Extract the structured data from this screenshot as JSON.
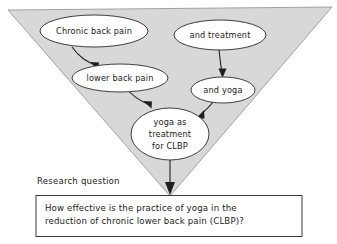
{
  "diagram": {
    "type": "funnel-concept-map",
    "funnel": {
      "name": "inverted-triangle-funnel",
      "fill_color": "#d8d8d8",
      "stroke_color": "#9a9a9a"
    },
    "nodes": [
      {
        "id": "chronic-back-pain",
        "label": "Chronic back pain",
        "lines": [
          "Chronic back pain"
        ]
      },
      {
        "id": "and-treatment",
        "label": "and treatment",
        "lines": [
          "and treatment"
        ]
      },
      {
        "id": "lower-back-pain",
        "label": "lower back pain",
        "lines": [
          "lower back pain"
        ]
      },
      {
        "id": "and-yoga",
        "label": "and yoga",
        "lines": [
          "and yoga"
        ]
      },
      {
        "id": "yoga-as-treatment-for-clbp",
        "label": "yoga as treatment for CLBP",
        "lines": [
          "yoga as",
          "treatment",
          "for CLBP"
        ]
      }
    ],
    "edges": [
      {
        "from": "chronic-back-pain",
        "to": "lower-back-pain"
      },
      {
        "from": "lower-back-pain",
        "to": "yoga-as-treatment-for-clbp"
      },
      {
        "from": "and-treatment",
        "to": "and-yoga"
      },
      {
        "from": "and-yoga",
        "to": "yoga-as-treatment-for-clbp"
      },
      {
        "from": "yoga-as-treatment-for-clbp",
        "to": "research-question-box"
      }
    ]
  },
  "research_question": {
    "caption": "Research question",
    "line1": "How effective is the practice of yoga in the",
    "line2": "reduction of chronic lower back pain (CLBP)?"
  },
  "colors": {
    "funnel_fill": "#d8d8d8",
    "funnel_stroke": "#9a9a9a",
    "node_stroke": "#2a2a2a",
    "ink": "#1f1f1f",
    "page_background": "#ffffff"
  }
}
